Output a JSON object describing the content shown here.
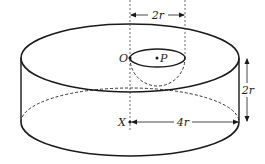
{
  "diagram": {
    "type": "cylinder-with-hemispherical-hole",
    "labels": {
      "point_o": "O",
      "point_p": "P",
      "point_x": "X",
      "hole_diameter": "2r",
      "height": "2r",
      "radius": "4r"
    },
    "colors": {
      "stroke": "#1a1a1a",
      "dashed": "#333333",
      "background": "#ffffff"
    }
  }
}
